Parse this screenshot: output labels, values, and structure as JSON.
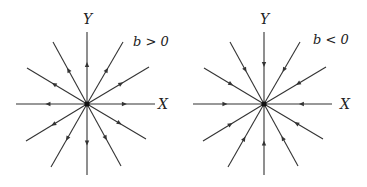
{
  "panels": [
    {
      "condition": "b > 0",
      "x_axis_label": "X",
      "y_axis_label": "Y",
      "flow_direction": "outward",
      "center": [
        87,
        104
      ]
    },
    {
      "condition": "b < 0",
      "x_axis_label": "X",
      "y_axis_label": "Y",
      "flow_direction": "inward",
      "center": [
        264,
        104
      ]
    }
  ],
  "rays": [
    [
      0,
      -72
    ],
    [
      0,
      71
    ],
    [
      -71,
      0
    ],
    [
      68,
      0
    ],
    [
      -34,
      -62
    ],
    [
      36,
      -62
    ],
    [
      -60,
      -36
    ],
    [
      62,
      -37
    ],
    [
      -36,
      63
    ],
    [
      34,
      62
    ],
    [
      -61,
      37
    ],
    [
      59,
      35
    ]
  ],
  "colors": {
    "line": "#333333",
    "text": "#222222",
    "background": "#ffffff"
  }
}
